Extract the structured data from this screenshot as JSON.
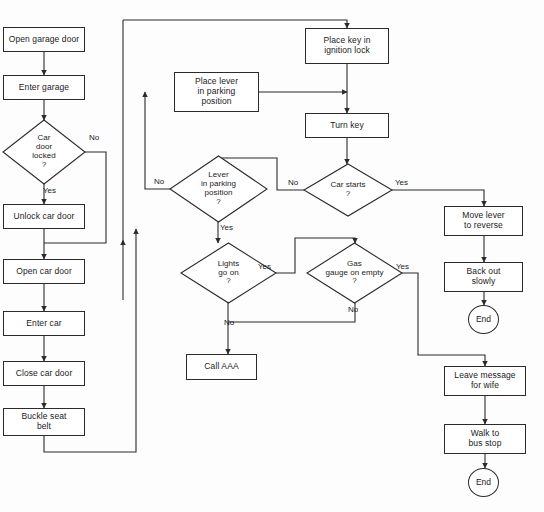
{
  "diagram": {
    "line_color": "#2b2b2b",
    "text_color": "#1a1a1a",
    "background": "#fdfdfd"
  },
  "nodes": [
    {
      "id": "open_garage_door",
      "type": "process",
      "label": "Open garage door",
      "x": 3,
      "y": 27,
      "w": 82,
      "h": 25
    },
    {
      "id": "enter_garage",
      "type": "process",
      "label": "Enter garage",
      "x": 3,
      "y": 75,
      "w": 82,
      "h": 25
    },
    {
      "id": "car_door_locked",
      "type": "decision",
      "label": "Car\ndoor\nlocked\n?",
      "x": 3,
      "y": 120,
      "w": 82,
      "h": 64
    },
    {
      "id": "unlock_car_door",
      "type": "process",
      "label": "Unlock car door",
      "x": 3,
      "y": 204,
      "w": 82,
      "h": 25
    },
    {
      "id": "open_car_door",
      "type": "process",
      "label": "Open car door",
      "x": 3,
      "y": 259,
      "w": 82,
      "h": 25
    },
    {
      "id": "enter_car",
      "type": "process",
      "label": "Enter car",
      "x": 3,
      "y": 311,
      "w": 82,
      "h": 25
    },
    {
      "id": "close_car_door",
      "type": "process",
      "label": "Close car door",
      "x": 3,
      "y": 361,
      "w": 82,
      "h": 25
    },
    {
      "id": "buckle_seat_belt",
      "type": "process",
      "label": "Buckle seat\nbelt",
      "x": 3,
      "y": 408,
      "w": 82,
      "h": 28
    },
    {
      "id": "place_lever_park",
      "type": "process",
      "label": "Place lever\nin parking\nposition",
      "x": 174,
      "y": 72,
      "w": 85,
      "h": 40
    },
    {
      "id": "lever_in_parking",
      "type": "decision",
      "label": "Lever\nin parking\nposition\n?",
      "x": 170,
      "y": 156,
      "w": 97,
      "h": 66
    },
    {
      "id": "lights_go_on",
      "type": "decision",
      "label": "Lights\ngo on\n?",
      "x": 181,
      "y": 243,
      "w": 95,
      "h": 60
    },
    {
      "id": "call_aaa",
      "type": "process",
      "label": "Call AAA",
      "x": 186,
      "y": 354,
      "w": 71,
      "h": 26
    },
    {
      "id": "place_key",
      "type": "process",
      "label": "Place key in\nignition lock",
      "x": 305,
      "y": 28,
      "w": 84,
      "h": 36
    },
    {
      "id": "turn_key",
      "type": "process",
      "label": "Turn key",
      "x": 305,
      "y": 113,
      "w": 84,
      "h": 25
    },
    {
      "id": "car_starts",
      "type": "decision",
      "label": "Car starts\n?",
      "x": 304,
      "y": 164,
      "w": 88,
      "h": 52
    },
    {
      "id": "gas_gauge_empty",
      "type": "decision",
      "label": "Gas\ngauge on empty\n?",
      "x": 307,
      "y": 243,
      "w": 95,
      "h": 60
    },
    {
      "id": "move_lever_reverse",
      "type": "process",
      "label": "Move lever\nto reverse",
      "x": 444,
      "y": 206,
      "w": 79,
      "h": 30
    },
    {
      "id": "back_out_slowly",
      "type": "process",
      "label": "Back out\nslowly",
      "x": 444,
      "y": 262,
      "w": 79,
      "h": 30
    },
    {
      "id": "end_top",
      "type": "terminal",
      "label": "End",
      "x": 468,
      "y": 305,
      "w": 31,
      "h": 29
    },
    {
      "id": "leave_message",
      "type": "process",
      "label": "Leave message\nfor wife",
      "x": 444,
      "y": 366,
      "w": 82,
      "h": 30
    },
    {
      "id": "walk_to_bus_stop",
      "type": "process",
      "label": "Walk to\nbus stop",
      "x": 444,
      "y": 424,
      "w": 82,
      "h": 30
    },
    {
      "id": "end_bottom",
      "type": "terminal",
      "label": "End",
      "x": 468,
      "y": 468,
      "w": 31,
      "h": 29
    }
  ],
  "edge_labels": [
    {
      "id": "lbl_locked_no",
      "text": "No",
      "x": 89,
      "y": 133
    },
    {
      "id": "lbl_locked_yes",
      "text": "Yes",
      "x": 43,
      "y": 186
    },
    {
      "id": "lbl_lever_no",
      "text": "No",
      "x": 154,
      "y": 177
    },
    {
      "id": "lbl_lever_yes",
      "text": "Yes",
      "x": 220,
      "y": 223
    },
    {
      "id": "lbl_lights_yes",
      "text": "Yes",
      "x": 258,
      "y": 262
    },
    {
      "id": "lbl_lights_no",
      "text": "No",
      "x": 224,
      "y": 318
    },
    {
      "id": "lbl_starts_no",
      "text": "No",
      "x": 288,
      "y": 178
    },
    {
      "id": "lbl_starts_yes",
      "text": "Yes",
      "x": 395,
      "y": 178
    },
    {
      "id": "lbl_gas_yes",
      "text": "Yes",
      "x": 396,
      "y": 262
    },
    {
      "id": "lbl_gas_no",
      "text": "No",
      "x": 348,
      "y": 305
    }
  ],
  "edges": [
    {
      "id": "e_open_to_enter",
      "from": "open_garage_door",
      "to": "enter_garage"
    },
    {
      "id": "e_enter_to_locked",
      "from": "enter_garage",
      "to": "car_door_locked"
    },
    {
      "id": "e_locked_yes",
      "from": "car_door_locked",
      "to": "unlock_car_door",
      "label": "Yes"
    },
    {
      "id": "e_locked_no",
      "from": "car_door_locked",
      "to": "open_car_door",
      "label": "No"
    },
    {
      "id": "e_unlock_to_open",
      "from": "unlock_car_door",
      "to": "open_car_door"
    },
    {
      "id": "e_open_to_entercar",
      "from": "open_car_door",
      "to": "enter_car"
    },
    {
      "id": "e_entercar_to_close",
      "from": "enter_car",
      "to": "close_car_door"
    },
    {
      "id": "e_close_to_buckle",
      "from": "close_car_door",
      "to": "buckle_seat_belt"
    },
    {
      "id": "e_buckle_to_placekey",
      "from": "buckle_seat_belt",
      "to": "place_key"
    },
    {
      "id": "e_placelever_to_key",
      "from": "place_lever_park",
      "to": "place_key"
    },
    {
      "id": "e_key_to_turn",
      "from": "place_key",
      "to": "turn_key"
    },
    {
      "id": "e_turn_to_starts",
      "from": "turn_key",
      "to": "car_starts"
    },
    {
      "id": "e_starts_yes",
      "from": "car_starts",
      "to": "move_lever_reverse",
      "label": "Yes"
    },
    {
      "id": "e_starts_no",
      "from": "car_starts",
      "to": "lever_in_parking",
      "label": "No"
    },
    {
      "id": "e_lever_no",
      "from": "lever_in_parking",
      "to": "place_lever_park",
      "label": "No"
    },
    {
      "id": "e_lever_yes",
      "from": "lever_in_parking",
      "to": "lights_go_on",
      "label": "Yes"
    },
    {
      "id": "e_lights_yes",
      "from": "lights_go_on",
      "to": "gas_gauge_empty",
      "label": "Yes"
    },
    {
      "id": "e_lights_no",
      "from": "lights_go_on",
      "to": "call_aaa",
      "label": "No"
    },
    {
      "id": "e_gas_no",
      "from": "gas_gauge_empty",
      "to": "call_aaa",
      "label": "No"
    },
    {
      "id": "e_gas_yes",
      "from": "gas_gauge_empty",
      "to": "leave_message",
      "label": "Yes"
    },
    {
      "id": "e_move_to_back",
      "from": "move_lever_reverse",
      "to": "back_out_slowly"
    },
    {
      "id": "e_back_to_end",
      "from": "back_out_slowly",
      "to": "end_top"
    },
    {
      "id": "e_leave_to_walk",
      "from": "leave_message",
      "to": "walk_to_bus_stop"
    },
    {
      "id": "e_walk_to_end",
      "from": "walk_to_bus_stop",
      "to": "end_bottom"
    }
  ],
  "connectors": [
    {
      "id": "c1",
      "d": "M 44,52 L 44,75",
      "arrow": "end"
    },
    {
      "id": "c2",
      "d": "M 44,100 L 44,120",
      "arrow": "end"
    },
    {
      "id": "c3",
      "d": "M 44,184 L 44,204",
      "arrow": "end"
    },
    {
      "id": "c4",
      "d": "M 85,152 L 106,152 L 106,243 L 44,243",
      "arrow": "none"
    },
    {
      "id": "c5",
      "d": "M 44,229 L 44,259",
      "arrow": "end"
    },
    {
      "id": "c6",
      "d": "M 44,284 L 44,311",
      "arrow": "end"
    },
    {
      "id": "c7",
      "d": "M 44,336 L 44,361",
      "arrow": "end"
    },
    {
      "id": "c8",
      "d": "M 44,386 L 44,408",
      "arrow": "end"
    },
    {
      "id": "c9",
      "d": "M 44,436 L 44,452 L 136,452 L 136,229",
      "arrow": "end"
    },
    {
      "id": "c10",
      "d": "M 123,20 L 347,20 L 347,28",
      "arrow": "end"
    },
    {
      "id": "c11",
      "d": "M 259,92 L 347,92",
      "arrow": "end"
    },
    {
      "id": "c12",
      "d": "M 347,64 L 347,113",
      "arrow": "end"
    },
    {
      "id": "c13",
      "d": "M 347,138 L 347,164",
      "arrow": "end"
    },
    {
      "id": "c14",
      "d": "M 392,190 L 484,190 L 484,206",
      "arrow": "end"
    },
    {
      "id": "c15",
      "d": "M 304,190 L 277,190 L 277,158 L 218,158 L 218,156",
      "arrow": "end"
    },
    {
      "id": "c16",
      "d": "M 170,189 L 145,189 L 145,92",
      "arrow": "end"
    },
    {
      "id": "c17",
      "d": "M 218,222 L 218,243",
      "arrow": "end"
    },
    {
      "id": "c18",
      "d": "M 276,273 L 295,273 L 295,238 L 355,238 L 355,243",
      "arrow": "end"
    },
    {
      "id": "c19",
      "d": "M 228,303 L 228,354",
      "arrow": "end"
    },
    {
      "id": "c20",
      "d": "M 355,303 L 355,322 L 228,322",
      "arrow": "none"
    },
    {
      "id": "c21",
      "d": "M 402,273 L 418,273 L 418,355 L 485,355 L 485,366",
      "arrow": "end"
    },
    {
      "id": "c22",
      "d": "M 484,236 L 484,262",
      "arrow": "end"
    },
    {
      "id": "c23",
      "d": "M 484,292 L 484,305",
      "arrow": "end"
    },
    {
      "id": "c24",
      "d": "M 485,396 L 485,424",
      "arrow": "end"
    },
    {
      "id": "c25",
      "d": "M 485,454 L 485,468",
      "arrow": "end"
    },
    {
      "id": "c26",
      "d": "M 123,20 L 123,240",
      "arrow": "none"
    },
    {
      "id": "c27",
      "d": "M 123,240 L 123,300",
      "arrow": "start"
    }
  ]
}
